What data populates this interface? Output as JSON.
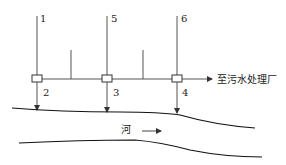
{
  "diagram": {
    "title": "",
    "inlet_labels": [
      "1",
      "5",
      "6"
    ],
    "outlet_labels": [
      "2",
      "3",
      "4"
    ],
    "destination_label": "至污水处理厂",
    "river_label": "河",
    "colors": {
      "line": "#555555",
      "river_bank": "#111111",
      "text": "#222222"
    }
  }
}
